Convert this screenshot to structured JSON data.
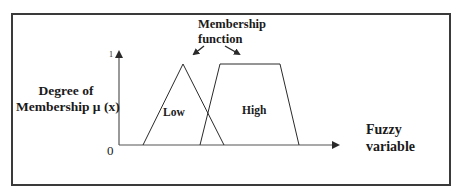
{
  "diagram": {
    "title_annotation": {
      "line1": "Membership",
      "line2": "function"
    },
    "y_axis": {
      "label_line1": "Degree of",
      "label_line2": "Membership μ (x)",
      "tick_max": "1",
      "origin": "0"
    },
    "x_axis": {
      "label_line1": "Fuzzy",
      "label_line2": "variable"
    },
    "sets": [
      {
        "name": "Low",
        "shape": "triangle",
        "points": [
          0.11,
          0.29,
          0.48
        ]
      },
      {
        "name": "High",
        "shape": "trapezoid",
        "points": [
          0.37,
          0.46,
          0.73,
          0.82
        ]
      }
    ],
    "colors": {
      "stroke": "#2a2a2a",
      "frame": "#3a3a3a",
      "background": "#ffffff"
    }
  }
}
